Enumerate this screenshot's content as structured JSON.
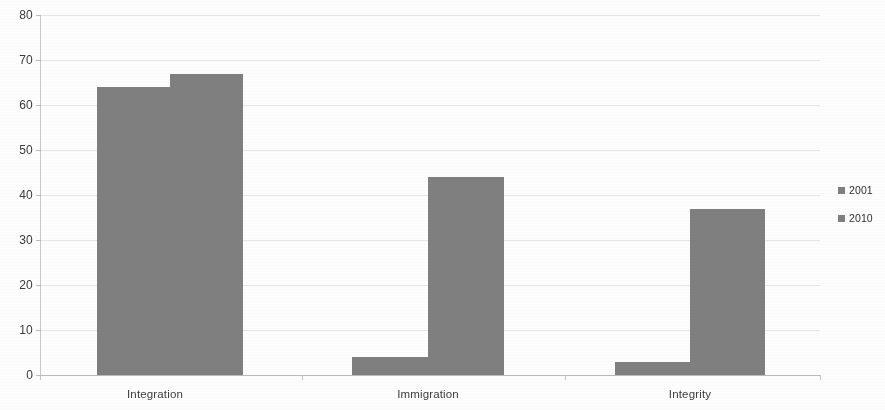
{
  "chart_data": {
    "type": "bar",
    "title": "",
    "xlabel": "",
    "ylabel": "",
    "categories": [
      "Integration",
      "Immigration",
      "Integrity"
    ],
    "series": [
      {
        "name": "2001",
        "values": [
          64,
          4,
          3
        ]
      },
      {
        "name": "2010",
        "values": [
          67,
          44,
          37
        ]
      }
    ],
    "ylim": [
      0,
      80
    ],
    "ytick_labels": [
      "80",
      "70",
      "60",
      "50",
      "40",
      "30",
      "20",
      "10",
      "0"
    ],
    "ytick_values": [
      80,
      70,
      60,
      50,
      40,
      30,
      20,
      10,
      0
    ],
    "grid": true,
    "legend_position": "right",
    "bar_color": "#7f7f7f",
    "gridline_color": "#dcdcdc",
    "axis_color": "#bdbdbd",
    "background_color": "#fdfdfd"
  },
  "legend": {
    "items": [
      {
        "label": "2001",
        "color": "#7f7f7f"
      },
      {
        "label": "2010",
        "color": "#7f7f7f"
      }
    ]
  },
  "axis": {
    "y_labels": [
      "80",
      "70",
      "60",
      "50",
      "40",
      "30",
      "20",
      "10",
      "0"
    ],
    "x_labels": [
      "Integration",
      "Immigration",
      "Integrity"
    ]
  }
}
